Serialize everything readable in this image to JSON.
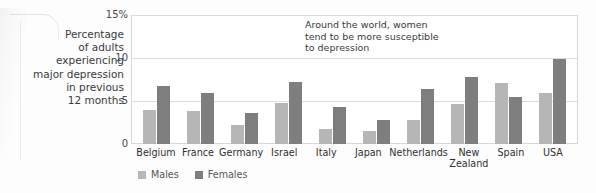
{
  "caption": {
    "lines": [
      "Percentage",
      "of adults",
      "experiencing",
      "major depression",
      "in previous",
      "12 months"
    ]
  },
  "annotation": {
    "text": "Around the world, women\ntend to be more susceptible\nto depression"
  },
  "legend": {
    "males_label": "Males",
    "females_label": "Females"
  },
  "axis": {
    "ticks": [
      "15%",
      "10",
      "5",
      "0"
    ]
  },
  "colors": {
    "male_bar": "#b6b6b6",
    "female_bar": "#7e7e7e",
    "gridline": "#dcdcdc",
    "plot_border": "#d8d8d8",
    "text": "#3a3a3a"
  },
  "chart_data": {
    "type": "bar",
    "title": "",
    "subtitle": "",
    "xlabel": "",
    "ylabel": "Percentage of adults experiencing major depression in previous 12 months",
    "ylim": [
      0,
      15
    ],
    "yticks": [
      0,
      5,
      10,
      15
    ],
    "ytick_labels": [
      "0",
      "5",
      "10",
      "15%"
    ],
    "grid": true,
    "legend_position": "bottom-left",
    "annotations": [
      "Around the world, women tend to be more susceptible to depression"
    ],
    "categories": [
      "Belgium",
      "France",
      "Germany",
      "Israel",
      "Italy",
      "Japan",
      "Netherlands",
      "New\nZealand",
      "Spain",
      "USA"
    ],
    "series": [
      {
        "name": "Males",
        "color": "#b6b6b6",
        "values": [
          4.0,
          3.8,
          2.2,
          4.8,
          1.7,
          1.5,
          2.8,
          4.7,
          7.1,
          5.9
        ]
      },
      {
        "name": "Females",
        "color": "#7e7e7e",
        "values": [
          6.8,
          5.9,
          3.6,
          7.2,
          4.3,
          2.8,
          6.4,
          7.8,
          5.5,
          9.9
        ]
      }
    ]
  }
}
